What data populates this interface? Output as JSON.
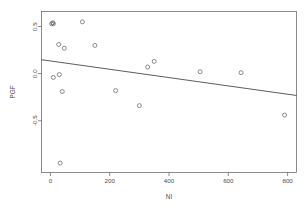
{
  "chart_data": {
    "type": "scatter",
    "title": "",
    "xlabel": "NI",
    "ylabel": "PGF",
    "xlim": [
      -30,
      830
    ],
    "ylim": [
      -1.05,
      0.66
    ],
    "grid": false,
    "legend": null,
    "x_ticks": [
      0,
      200,
      400,
      600,
      800
    ],
    "x_tick_labels": [
      "0",
      "200",
      "400",
      "600",
      "800"
    ],
    "y_ticks": [
      0.5,
      0.0,
      -0.5
    ],
    "y_tick_labels": [
      "0.5",
      "0.0",
      "-0.5"
    ],
    "marker": "open-circle",
    "points": [
      {
        "x": 4,
        "y": 0.53
      },
      {
        "x": 10,
        "y": 0.53
      },
      {
        "x": 8,
        "y": 0.54
      },
      {
        "x": 108,
        "y": 0.55
      },
      {
        "x": 28,
        "y": 0.31
      },
      {
        "x": 47,
        "y": 0.27
      },
      {
        "x": 150,
        "y": 0.3
      },
      {
        "x": 350,
        "y": 0.13
      },
      {
        "x": 328,
        "y": 0.07
      },
      {
        "x": 505,
        "y": 0.02
      },
      {
        "x": 643,
        "y": 0.01
      },
      {
        "x": 10,
        "y": -0.04
      },
      {
        "x": 30,
        "y": -0.01
      },
      {
        "x": 40,
        "y": -0.19
      },
      {
        "x": 220,
        "y": -0.18
      },
      {
        "x": 300,
        "y": -0.34
      },
      {
        "x": 790,
        "y": -0.44
      },
      {
        "x": 33,
        "y": -0.95
      }
    ],
    "fit_line": {
      "type": "linear-regression",
      "x_start": -30,
      "y_start": 0.148,
      "x_end": 830,
      "y_end": -0.232
    }
  }
}
